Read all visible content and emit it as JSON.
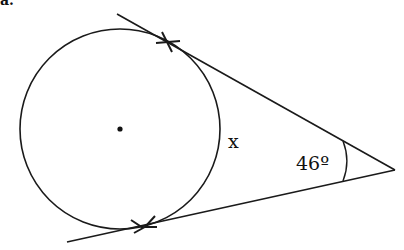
{
  "figure": {
    "corner_text": "a.",
    "arc_label": "x",
    "angle_label": "46º",
    "stroke_color": "#1a1a1a"
  }
}
